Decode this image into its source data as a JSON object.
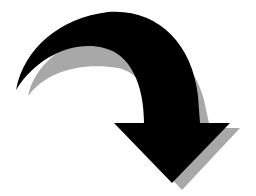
{
  "image": {
    "subject": "curved arrow pointing down-right",
    "alt_text": "Curved arrow",
    "colors": {
      "background": "#ffffff",
      "arrow": "#000000",
      "shadow": "#a8a8a8"
    }
  },
  "icons": {
    "main": "curved-arrow-down-icon",
    "shadow": "arrow-shadow"
  }
}
